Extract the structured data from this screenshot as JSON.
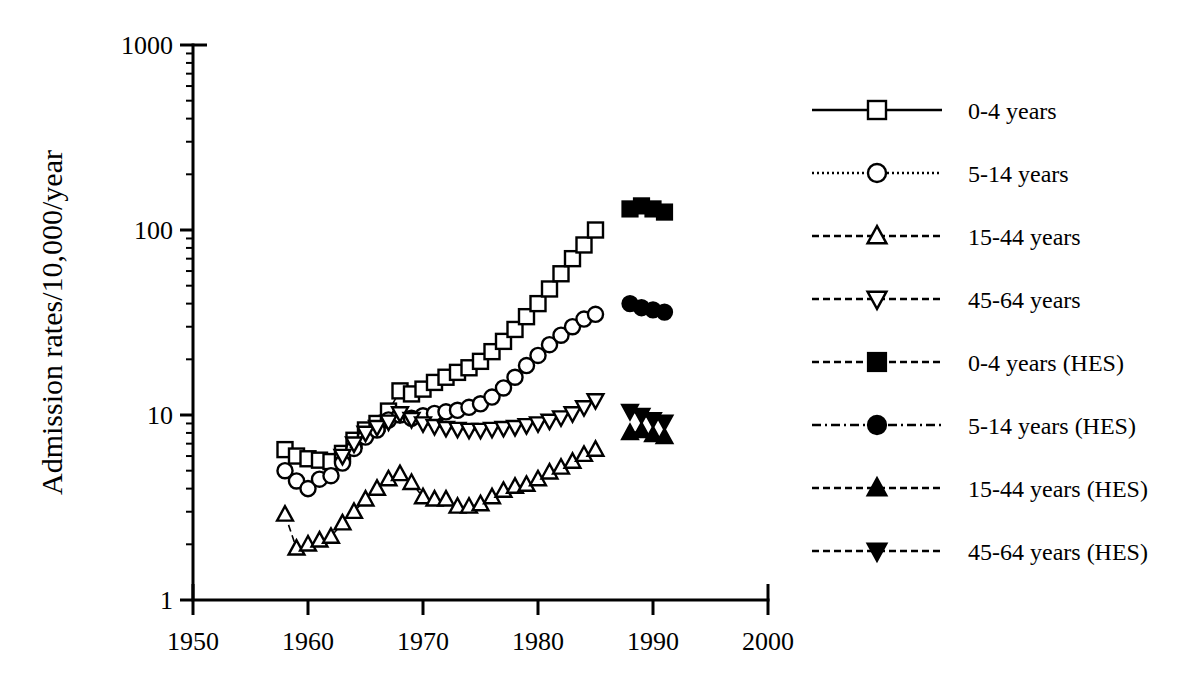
{
  "chart_data": {
    "type": "scatter",
    "title": "",
    "xlabel": "",
    "ylabel": "Admission rates/10,000/year",
    "xlim": [
      1950,
      2000
    ],
    "ylim": [
      1,
      1000
    ],
    "yscale": "log",
    "grid": false,
    "legend_position": "right",
    "xticks": [
      "1950",
      "1960",
      "1970",
      "1980",
      "1990",
      "2000"
    ],
    "xtick_values": [
      1950,
      1960,
      1970,
      1980,
      1990,
      2000
    ],
    "yticks": [
      "1",
      "10",
      "100",
      "1000"
    ],
    "ytick_values": [
      1,
      10,
      100,
      1000
    ],
    "series": [
      {
        "name": "0-4 years",
        "marker": "open-square",
        "linestyle": "solid",
        "x": [
          1958,
          1959,
          1960,
          1961,
          1962,
          1963,
          1964,
          1965,
          1966,
          1967,
          1968,
          1969,
          1970,
          1971,
          1972,
          1973,
          1974,
          1975,
          1976,
          1977,
          1978,
          1979,
          1980,
          1981,
          1982,
          1983,
          1984,
          1985
        ],
        "values": [
          6.5,
          6.0,
          5.8,
          5.7,
          5.6,
          6.2,
          7.3,
          8.3,
          9.0,
          10.5,
          13.5,
          13.0,
          13.8,
          15.0,
          16.0,
          17.0,
          18.0,
          19.5,
          22.0,
          25.0,
          29.0,
          34.0,
          40.0,
          48.0,
          58.0,
          70.0,
          83.0,
          100.0
        ]
      },
      {
        "name": "5-14 years",
        "marker": "open-circle",
        "linestyle": "dotted",
        "x": [
          1958,
          1959,
          1960,
          1961,
          1962,
          1963,
          1964,
          1965,
          1966,
          1967,
          1968,
          1969,
          1970,
          1971,
          1972,
          1973,
          1974,
          1975,
          1976,
          1977,
          1978,
          1979,
          1980,
          1981,
          1982,
          1983,
          1984,
          1985
        ],
        "values": [
          5.0,
          4.4,
          4.0,
          4.5,
          4.7,
          5.5,
          6.6,
          7.6,
          8.3,
          9.4,
          10.0,
          9.6,
          9.9,
          10.2,
          10.4,
          10.6,
          11.0,
          11.5,
          12.5,
          14.0,
          16.0,
          18.5,
          21.0,
          24.0,
          27.0,
          30.0,
          33.0,
          35.0
        ]
      },
      {
        "name": "15-44 years",
        "marker": "open-triangle-up",
        "linestyle": "dashed",
        "x": [
          1958,
          1959,
          1960,
          1961,
          1962,
          1963,
          1964,
          1965,
          1966,
          1967,
          1968,
          1969,
          1970,
          1971,
          1972,
          1973,
          1974,
          1975,
          1976,
          1977,
          1978,
          1979,
          1980,
          1981,
          1982,
          1983,
          1984,
          1985
        ],
        "values": [
          2.9,
          1.9,
          2.0,
          2.1,
          2.2,
          2.6,
          3.0,
          3.5,
          4.0,
          4.5,
          4.8,
          4.3,
          3.6,
          3.5,
          3.5,
          3.2,
          3.2,
          3.3,
          3.6,
          3.9,
          4.1,
          4.2,
          4.5,
          4.9,
          5.2,
          5.6,
          6.1,
          6.5
        ]
      },
      {
        "name": "45-64 years",
        "marker": "open-triangle-down",
        "linestyle": "dashed",
        "x": [
          1963,
          1964,
          1965,
          1966,
          1967,
          1968,
          1969,
          1970,
          1971,
          1972,
          1973,
          1974,
          1975,
          1976,
          1977,
          1978,
          1979,
          1980,
          1981,
          1982,
          1983,
          1984,
          1985
        ],
        "values": [
          6.0,
          7.0,
          8.0,
          8.6,
          9.2,
          10.2,
          9.5,
          9.0,
          8.7,
          8.5,
          8.4,
          8.3,
          8.3,
          8.4,
          8.5,
          8.6,
          8.8,
          9.0,
          9.3,
          9.7,
          10.2,
          11.0,
          12.0
        ]
      },
      {
        "name": "0-4 years (HES)",
        "marker": "filled-square",
        "linestyle": "dashed",
        "x": [
          1988,
          1989,
          1990,
          1991
        ],
        "values": [
          130,
          135,
          130,
          125
        ]
      },
      {
        "name": "5-14 years (HES)",
        "marker": "filled-circle",
        "linestyle": "dash-dot",
        "x": [
          1988,
          1989,
          1990,
          1991
        ],
        "values": [
          40,
          38,
          37,
          36
        ]
      },
      {
        "name": "15-44 years (HES)",
        "marker": "filled-triangle-up",
        "linestyle": "dashed",
        "x": [
          1988,
          1989,
          1990,
          1991
        ],
        "values": [
          8.0,
          8.2,
          7.8,
          7.6
        ]
      },
      {
        "name": "45-64 years (HES)",
        "marker": "filled-triangle-down",
        "linestyle": "dashed",
        "x": [
          1988,
          1989,
          1990,
          1991
        ],
        "values": [
          10.5,
          10.0,
          9.5,
          9.2
        ]
      }
    ]
  },
  "axes": {
    "ylabel": "Admission rates/10,000/year",
    "ytick_labels": [
      "1000",
      "100",
      "10",
      "1"
    ],
    "xtick_labels": [
      "1950",
      "1960",
      "1970",
      "1980",
      "1990",
      "2000"
    ]
  },
  "legend": {
    "entries": [
      {
        "label": "0-4 years",
        "marker": "open-square",
        "linestyle": "solid"
      },
      {
        "label": "5-14 years",
        "marker": "open-circle",
        "linestyle": "dotted"
      },
      {
        "label": "15-44 years",
        "marker": "open-triangle-up",
        "linestyle": "dashed"
      },
      {
        "label": "45-64 years",
        "marker": "open-triangle-down",
        "linestyle": "dashed"
      },
      {
        "label": "0-4 years (HES)",
        "marker": "filled-square",
        "linestyle": "dashed"
      },
      {
        "label": "5-14 years (HES)",
        "marker": "filled-circle",
        "linestyle": "dash-dot"
      },
      {
        "label": "15-44 years (HES)",
        "marker": "filled-triangle-up",
        "linestyle": "dashed"
      },
      {
        "label": "45-64 years (HES)",
        "marker": "filled-triangle-down",
        "linestyle": "dashed"
      }
    ]
  },
  "colors": {
    "ink": "#000000",
    "paper": "#ffffff"
  }
}
